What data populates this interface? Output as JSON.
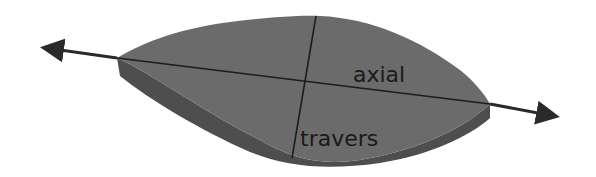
{
  "diagram": {
    "labels": {
      "axial": "axial",
      "transverse": "travers"
    },
    "colors": {
      "background": "#ffffff",
      "body_top": "#6b6b6b",
      "body_bottom": "#4e4e4e",
      "lines": "#1c1c1c",
      "arrows": "#2a2a2a"
    }
  }
}
